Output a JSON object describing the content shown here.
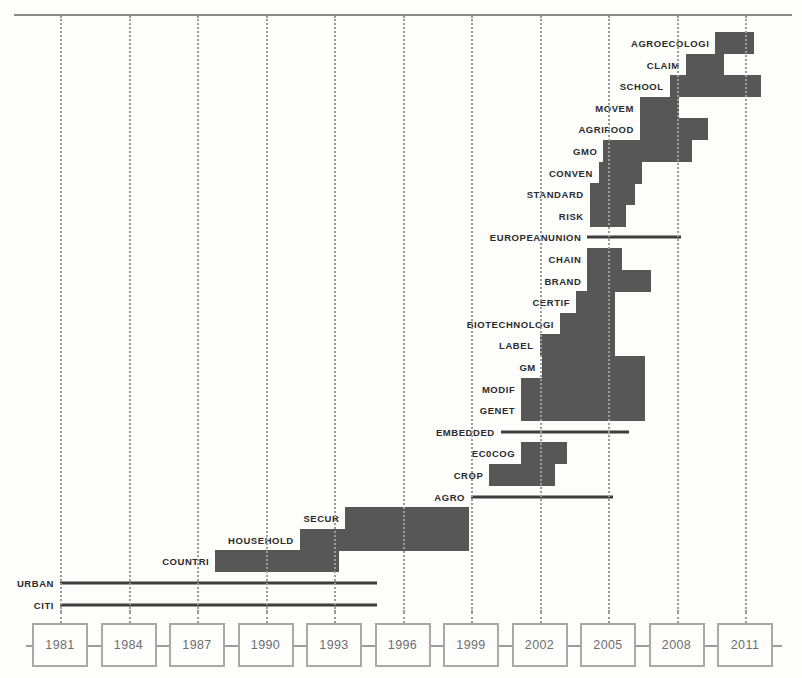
{
  "chart_data": {
    "type": "bar",
    "title": "",
    "subtitle": "",
    "xlabel": "",
    "ylabel": "",
    "orientation": "horizontal-timeline",
    "grid": true,
    "legend": null,
    "xlim": [
      1979.5,
      2012.5
    ],
    "axis_ticks": [
      "1981",
      "1984",
      "1987",
      "1990",
      "1993",
      "1996",
      "1999",
      "2002",
      "2005",
      "2008",
      "2011"
    ],
    "gridlines": [
      1981,
      1984,
      1987,
      1990,
      1993,
      1996,
      1999,
      2002,
      2005,
      2008,
      2011
    ],
    "colors": {
      "bar": "#575757",
      "baseline": "#3d3d3d",
      "grid": "#9a9a9a",
      "axis": "#9b9b9b",
      "year_box_border": "#a8a8a8",
      "year_text": "#6f6f6f",
      "label_text": "#2b2b2b",
      "background": "#fdfdfc"
    },
    "categories": [
      "AGROECOLOGI",
      "CLAIM",
      "SCHOOL",
      "MOVEM",
      "AGRIFOOD",
      "GMO",
      "CONVEN",
      "STANDARD",
      "RISK",
      "EUROPEANUNION",
      "CHAIN",
      "BRAND",
      "CERTIF",
      "BIOTECHNOLOGI",
      "LABEL",
      "GM",
      "MODIF",
      "GENET",
      "EMBEDDED",
      "EC0COG",
      "CROP",
      "AGRO",
      "SECUR",
      "HOUSEHOLD",
      "COUNTRI",
      "URBAN",
      "CITI"
    ],
    "bursts": [
      {
        "label": "AGROECOLOGI",
        "start": 2009.7,
        "end": 2011.4,
        "style": "thick",
        "baseline": false
      },
      {
        "label": "CLAIM",
        "start": 2008.4,
        "end": 2010.1,
        "style": "thick",
        "baseline": false
      },
      {
        "label": "SCHOOL",
        "start": 2007.7,
        "end": 2011.7,
        "style": "thick",
        "baseline": false
      },
      {
        "label": "MOVEM",
        "start": 2006.4,
        "end": 2008.1,
        "style": "thick",
        "baseline": false
      },
      {
        "label": "AGRIFOOD",
        "start": 2006.4,
        "end": 2009.4,
        "style": "thick",
        "baseline": false
      },
      {
        "label": "GMO",
        "start": 2004.8,
        "end": 2008.7,
        "style": "thick",
        "baseline": false
      },
      {
        "label": "CONVEN",
        "start": 2004.6,
        "end": 2006.5,
        "style": "thick",
        "baseline": false
      },
      {
        "label": "STANDARD",
        "start": 2004.2,
        "end": 2006.2,
        "style": "thick",
        "baseline": false
      },
      {
        "label": "RISK",
        "start": 2004.2,
        "end": 2005.8,
        "style": "thick",
        "baseline": false
      },
      {
        "label": "EUROPEANUNION",
        "start": 2004.1,
        "end": 2008.2,
        "style": "thin",
        "baseline": true
      },
      {
        "label": "CHAIN",
        "start": 2004.1,
        "end": 2005.6,
        "style": "thick",
        "baseline": false
      },
      {
        "label": "BRAND",
        "start": 2004.1,
        "end": 2006.9,
        "style": "thick",
        "baseline": false
      },
      {
        "label": "CERTIF",
        "start": 2003.6,
        "end": 2005.3,
        "style": "thick",
        "baseline": false
      },
      {
        "label": "BIOTECHNOLOGI",
        "start": 2002.9,
        "end": 2005.3,
        "style": "thick",
        "baseline": false
      },
      {
        "label": "LABEL",
        "start": 2002.0,
        "end": 2005.3,
        "style": "thick",
        "baseline": false
      },
      {
        "label": "GM",
        "start": 2002.1,
        "end": 2006.6,
        "style": "thick",
        "baseline": false
      },
      {
        "label": "MODIF",
        "start": 2001.2,
        "end": 2006.6,
        "style": "thick",
        "baseline": false
      },
      {
        "label": "GENET",
        "start": 2001.2,
        "end": 2006.6,
        "style": "thick",
        "baseline": false
      },
      {
        "label": "EMBEDDED",
        "start": 2000.3,
        "end": 2005.9,
        "style": "thin",
        "baseline": true
      },
      {
        "label": "EC0COG",
        "start": 2001.2,
        "end": 2003.2,
        "style": "thick",
        "baseline": false
      },
      {
        "label": "CROP",
        "start": 1999.8,
        "end": 2002.7,
        "style": "thick",
        "baseline": false
      },
      {
        "label": "AGRO",
        "start": 1999.0,
        "end": 2005.2,
        "style": "thin",
        "baseline": true
      },
      {
        "label": "SECUR",
        "start": 1993.5,
        "end": 1998.9,
        "style": "thick",
        "baseline": false
      },
      {
        "label": "HOUSEHOLD",
        "start": 1991.5,
        "end": 1998.9,
        "style": "thick",
        "baseline": false
      },
      {
        "label": "COUNTRI",
        "start": 1987.8,
        "end": 1993.2,
        "style": "thick",
        "baseline": false
      },
      {
        "label": "URBAN",
        "start": 1981.0,
        "end": 1994.9,
        "style": "thin",
        "baseline": true
      },
      {
        "label": "CITI",
        "start": 1981.0,
        "end": 1994.9,
        "style": "thin",
        "baseline": true
      }
    ]
  }
}
